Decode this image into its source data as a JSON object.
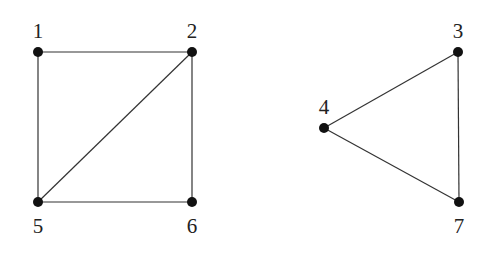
{
  "graph": {
    "nodes": [
      {
        "id": "1",
        "label": "1",
        "x": 38,
        "y": 52,
        "lx": 38,
        "ly": 38
      },
      {
        "id": "2",
        "label": "2",
        "x": 192,
        "y": 52,
        "lx": 192,
        "ly": 38
      },
      {
        "id": "3",
        "label": "3",
        "x": 458,
        "y": 52,
        "lx": 458,
        "ly": 38
      },
      {
        "id": "4",
        "label": "4",
        "x": 324,
        "y": 128,
        "lx": 324,
        "ly": 114
      },
      {
        "id": "5",
        "label": "5",
        "x": 38,
        "y": 202,
        "lx": 38,
        "ly": 233
      },
      {
        "id": "6",
        "label": "6",
        "x": 192,
        "y": 202,
        "lx": 192,
        "ly": 233
      },
      {
        "id": "7",
        "label": "7",
        "x": 459,
        "y": 202,
        "lx": 459,
        "ly": 233
      }
    ],
    "edges": [
      {
        "from": "1",
        "to": "2"
      },
      {
        "from": "1",
        "to": "5"
      },
      {
        "from": "2",
        "to": "5"
      },
      {
        "from": "2",
        "to": "6"
      },
      {
        "from": "5",
        "to": "6"
      },
      {
        "from": "3",
        "to": "4"
      },
      {
        "from": "3",
        "to": "7"
      },
      {
        "from": "4",
        "to": "7"
      }
    ]
  }
}
